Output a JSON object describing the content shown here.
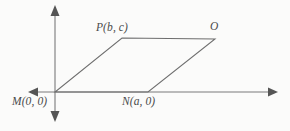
{
  "figure": {
    "type": "coordinate-geometry-diagram",
    "background_color": "#fbfbfa",
    "stroke_color": "#6e6e6e",
    "axis_color": "#7a7a7a",
    "label_color": "#4a4a4a",
    "axes": {
      "x_axis": {
        "name": "x-axis",
        "y": 92,
        "x_start": 30,
        "x_end": 276,
        "arrow_left": true,
        "arrow_right": true
      },
      "y_axis": {
        "name": "y-axis",
        "x": 55,
        "y_start": 7,
        "y_end": 120,
        "arrow_up": true,
        "arrow_down": true
      },
      "origin": {
        "x": 55,
        "y": 92
      }
    },
    "shape": {
      "name": "parallelogram",
      "vertices": [
        {
          "id": "M",
          "label": "M(0, 0)",
          "x": 55,
          "y": 92
        },
        {
          "id": "N",
          "label": "N(a, 0)",
          "x": 148,
          "y": 92
        },
        {
          "id": "O",
          "label": "O",
          "x": 215,
          "y": 39
        },
        {
          "id": "P",
          "label": "P(b, c)",
          "x": 122,
          "y": 38
        }
      ],
      "edges": [
        {
          "from": "M",
          "to": "N"
        },
        {
          "from": "N",
          "to": "O"
        },
        {
          "from": "O",
          "to": "P"
        },
        {
          "from": "P",
          "to": "M"
        }
      ]
    },
    "labels": {
      "P": "P(b, c)",
      "O": "O",
      "M": "M(0, 0)",
      "N": "N(a, 0)"
    }
  }
}
